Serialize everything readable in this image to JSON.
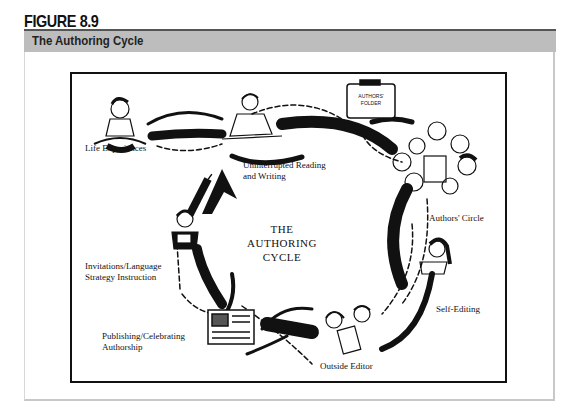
{
  "figure": {
    "number_label": "FIGURE 8.9",
    "title": "The Authoring Cycle"
  },
  "diagram": {
    "center_title": [
      "THE",
      "AUTHORING",
      "CYCLE"
    ],
    "stages": [
      {
        "id": "life-experiences",
        "label": "Life Experiences",
        "icon": "child-sitting-illustration"
      },
      {
        "id": "uninterrupted-reading-writing",
        "label_lines": [
          "Uninterrupted Reading",
          "and Writing"
        ],
        "icon": "student-writing-illustration"
      },
      {
        "id": "authors-folder",
        "label_lines": [
          "AUTHORS'",
          "FOLDER"
        ],
        "icon": "folder-illustration"
      },
      {
        "id": "authors-circle",
        "label": "Authors' Circle",
        "icon": "group-of-children-illustration"
      },
      {
        "id": "self-editing",
        "label": "Self-Editing",
        "icon": "child-editing-illustration"
      },
      {
        "id": "outside-editor",
        "label": "Outside Editor",
        "icon": "two-children-illustration"
      },
      {
        "id": "publishing-celebrating",
        "label_lines": [
          "Publishing/Celebrating",
          "Authorship"
        ],
        "icon": "published-book-illustration"
      },
      {
        "id": "invitations-strategy",
        "label_lines": [
          "Invitations/Language",
          "Strategy Instruction"
        ],
        "icon": "child-reading-illustration"
      }
    ],
    "colors": {
      "ink": "#111111",
      "header_band": "#bdbdbd",
      "frame": "#c8c8c8"
    }
  }
}
